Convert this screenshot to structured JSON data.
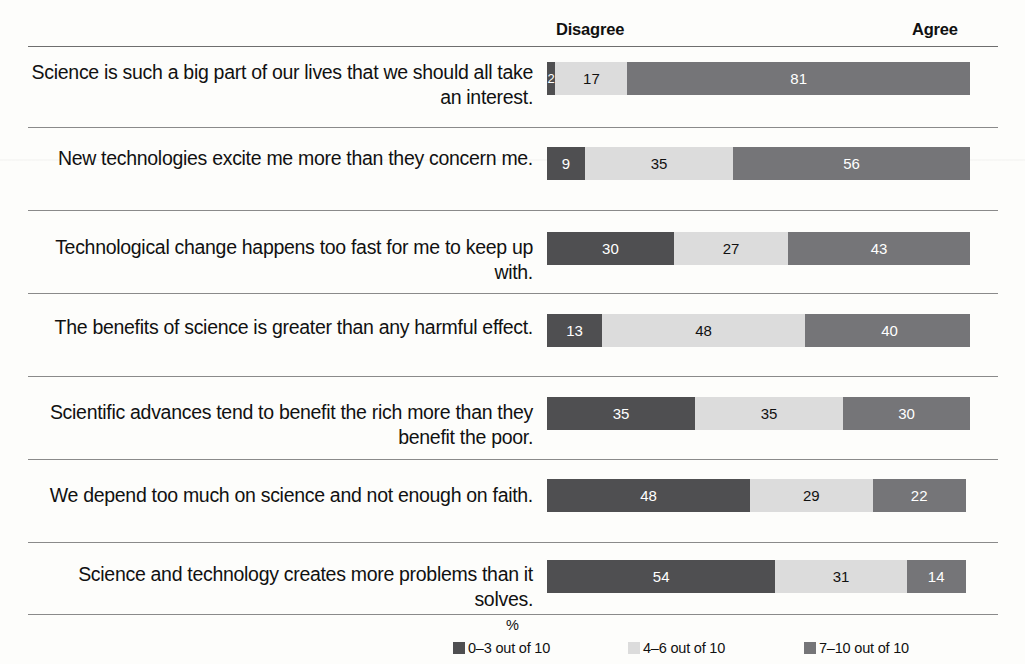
{
  "chart_data": {
    "type": "bar",
    "orientation": "horizontal",
    "stacked": true,
    "normalized_percent": true,
    "title": "",
    "subtitle": "",
    "xlabel": "%",
    "ylabel": "",
    "xlim": [
      0,
      100
    ],
    "grid": false,
    "legend_position": "bottom",
    "scale_labels": {
      "left": "Disagree",
      "right": "Agree"
    },
    "categories": [
      "Science is such a big part of our lives that we should all take an interest.",
      "New technologies excite me more than they concern me.",
      "Technological change happens too fast for me to keep up with.",
      "The benefits of science is greater than any harmful effect.",
      "Scientific advances tend to benefit the rich more than they benefit the poor.",
      "We depend too much on science and not enough on faith.",
      "Science and technology creates more problems than it solves."
    ],
    "series": [
      {
        "name": "0–3 out of 10",
        "color": "#4f4f51",
        "values": [
          2,
          9,
          30,
          13,
          35,
          48,
          54
        ]
      },
      {
        "name": "4–6 out of 10",
        "color": "#dcdcdc",
        "values": [
          17,
          35,
          27,
          48,
          35,
          29,
          31
        ]
      },
      {
        "name": "7–10 out of 10",
        "color": "#757578",
        "values": [
          81,
          56,
          43,
          40,
          30,
          22,
          14
        ]
      }
    ],
    "legend": [
      {
        "label": "0–3 out of 10",
        "color": "#4f4f51"
      },
      {
        "label": "4–6 out of 10",
        "color": "#dcdcdc"
      },
      {
        "label": "7–10 out of 10",
        "color": "#757578"
      }
    ]
  },
  "header": {
    "disagree": "Disagree",
    "agree": "Agree"
  },
  "rows": [
    {
      "label": "Science is such a big part of our lives that we should all take an interest.",
      "low": "2",
      "mid": "17",
      "high": "81"
    },
    {
      "label": "New technologies excite me more than they concern me.",
      "low": "9",
      "mid": "35",
      "high": "56"
    },
    {
      "label": "Technological change happens too fast for me to keep up with.",
      "low": "30",
      "mid": "27",
      "high": "43"
    },
    {
      "label": "The benefits of science is greater than any harmful effect.",
      "low": "13",
      "mid": "48",
      "high": "40"
    },
    {
      "label": "Scientific advances tend to benefit the rich more than they benefit the poor.",
      "low": "35",
      "mid": "35",
      "high": "30"
    },
    {
      "label": "We depend too much on science and not enough on faith.",
      "low": "48",
      "mid": "29",
      "high": "22"
    },
    {
      "label": "Science and technology creates more problems than it solves.",
      "low": "54",
      "mid": "31",
      "high": "14"
    }
  ],
  "axis": {
    "percent_label": "%"
  },
  "legend": {
    "item1": "0–3 out of 10",
    "item2": "4–6 out of 10",
    "item3": "7–10 out of 10"
  },
  "colors": {
    "low": "#4f4f51",
    "mid": "#dcdcdc",
    "high": "#757578",
    "rule": "#6e6e6e",
    "background": "#fdfdfb"
  }
}
